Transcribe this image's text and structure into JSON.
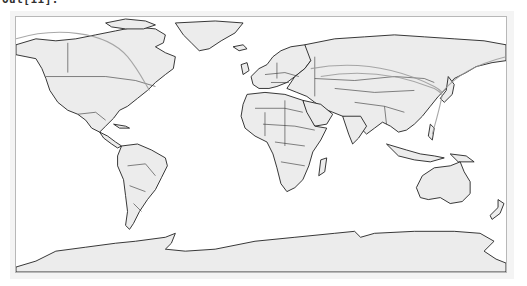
{
  "cell": {
    "prompt_label": "Out[11]:"
  },
  "map": {
    "projection": "PlateCarree",
    "land_color": "#ececec",
    "coastline_color": "#222222",
    "route_color": "#999999",
    "frame_border_color": "#b8b8b8",
    "output_background": "#f4f4f4",
    "routes": [
      {
        "name": "pacific-to-north-america",
        "from": "Pacific (west edge)",
        "to": "New York area"
      },
      {
        "name": "europe-to-east-asia-1",
        "from": "Northern Europe",
        "to": "Beijing / Korea"
      },
      {
        "name": "europe-to-east-asia-2",
        "from": "Eastern Europe",
        "to": "Beijing / Korea"
      },
      {
        "name": "korea-to-northeast",
        "from": "Korea",
        "to": "Bering (east edge)"
      },
      {
        "name": "korea-to-philippines",
        "from": "Korea",
        "to": "Philippines"
      }
    ]
  }
}
